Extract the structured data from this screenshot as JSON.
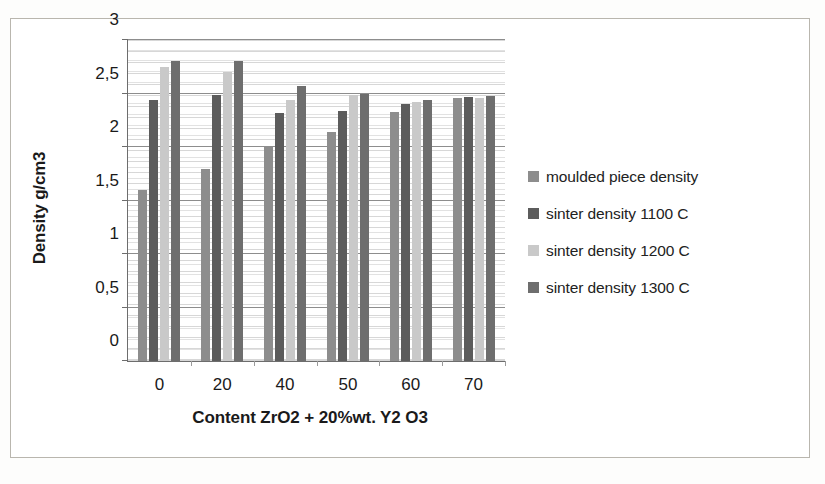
{
  "chart_data": {
    "type": "bar",
    "title": "",
    "xlabel": "Content ZrO2 + 20%wt. Y2 O3",
    "ylabel": "Density g/cm3",
    "categories": [
      "0",
      "20",
      "40",
      "50",
      "60",
      "70"
    ],
    "ylim": [
      0,
      3
    ],
    "ytick_labels": [
      "0",
      "0,5",
      "1",
      "1,5",
      "2",
      "2,5",
      "3"
    ],
    "ytick_values": [
      0,
      0.5,
      1,
      1.5,
      2,
      2.5,
      3
    ],
    "grid": true,
    "legend_position": "right",
    "series": [
      {
        "name": "moulded piece density",
        "color": "#8d8d8d",
        "values": [
          1.6,
          1.79,
          2.0,
          2.14,
          2.33,
          2.46
        ]
      },
      {
        "name": "sinter density 1100 C",
        "color": "#5c5c5c",
        "values": [
          2.44,
          2.49,
          2.32,
          2.34,
          2.4,
          2.47
        ]
      },
      {
        "name": "sinter density 1200 C",
        "color": "#c9c9c9",
        "values": [
          2.75,
          2.7,
          2.44,
          2.49,
          2.42,
          2.46
        ]
      },
      {
        "name": "sinter density 1300 C",
        "color": "#6e6e6e",
        "values": [
          2.8,
          2.8,
          2.57,
          2.5,
          2.44,
          2.48
        ]
      }
    ]
  },
  "legend": {
    "items": [
      {
        "label": "moulded piece density",
        "color": "#8d8d8d"
      },
      {
        "label": "sinter density 1100 C",
        "color": "#5c5c5c"
      },
      {
        "label": "sinter density 1200 C",
        "color": "#c9c9c9"
      },
      {
        "label": "sinter density 1300 C",
        "color": "#6e6e6e"
      }
    ]
  }
}
